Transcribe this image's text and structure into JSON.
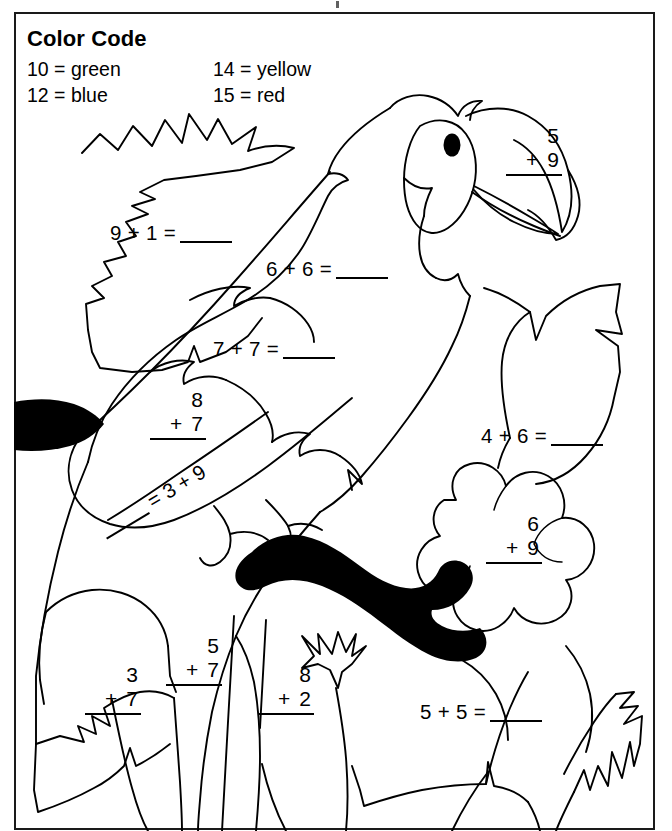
{
  "worksheet": {
    "legend_title": "Color Code",
    "legend": [
      {
        "code": "10 = green",
        "code2": "14 = yellow"
      },
      {
        "code": "12 = blue",
        "code2": "15 = red"
      }
    ],
    "legend_rows": [
      {
        "left": "10 = green",
        "right": "14 = yellow"
      },
      {
        "left": "12 = blue",
        "right": "15 = red"
      }
    ],
    "colors": {
      "green": "#2e8b2e",
      "blue": "#2b57c4",
      "yellow": "#e8d33a",
      "red": "#cf2222",
      "ink": "#000000",
      "paper": "#ffffff"
    },
    "problems": [
      {
        "id": "p1",
        "format": "horizontal",
        "text": "9 + 1 =",
        "a": "9",
        "b": "1",
        "answer": ""
      },
      {
        "id": "p2",
        "format": "horizontal",
        "text": "6 + 6 =",
        "a": "6",
        "b": "6",
        "answer": ""
      },
      {
        "id": "p3",
        "format": "horizontal",
        "text": "7 + 7 =",
        "a": "7",
        "b": "7",
        "answer": ""
      },
      {
        "id": "p4",
        "format": "vertical",
        "top": "5",
        "op": "+",
        "bottom": "9",
        "answer": ""
      },
      {
        "id": "p5",
        "format": "vertical",
        "top": "8",
        "op": "+",
        "bottom": "7",
        "answer": ""
      },
      {
        "id": "p6",
        "format": "reversed",
        "text": "= 3 + 9",
        "a": "3",
        "b": "9",
        "answer": ""
      },
      {
        "id": "p7",
        "format": "horizontal",
        "text": "4 + 6 =",
        "a": "4",
        "b": "6",
        "answer": ""
      },
      {
        "id": "p8",
        "format": "vertical",
        "top": "6",
        "op": "+",
        "bottom": "9",
        "answer": ""
      },
      {
        "id": "p9",
        "format": "vertical",
        "top": "3",
        "op": "+",
        "bottom": "7",
        "answer": ""
      },
      {
        "id": "p10",
        "format": "vertical",
        "top": "5",
        "op": "+",
        "bottom": "7",
        "answer": ""
      },
      {
        "id": "p11",
        "format": "vertical",
        "top": "8",
        "op": "+",
        "bottom": "2",
        "answer": ""
      },
      {
        "id": "p12",
        "format": "horizontal",
        "text": "5 + 5 =",
        "a": "5",
        "b": "5",
        "answer": ""
      }
    ],
    "p1": {
      "expr": "9 + 1 ="
    },
    "p2": {
      "expr": "6 + 6 ="
    },
    "p3": {
      "expr": "7 + 7 ="
    },
    "p4": {
      "top": "5",
      "bottom": "9",
      "op": "+"
    },
    "p5": {
      "top": "8",
      "bottom": "7",
      "op": "+"
    },
    "p6": {
      "expr": "= 3 + 9"
    },
    "p7": {
      "expr": "4 + 6 ="
    },
    "p8": {
      "top": "6",
      "bottom": "9",
      "op": "+"
    },
    "p9": {
      "top": "3",
      "bottom": "7",
      "op": "+"
    },
    "p10": {
      "top": "5",
      "bottom": "7",
      "op": "+"
    },
    "p11": {
      "top": "8",
      "bottom": "2",
      "op": "+"
    },
    "p12": {
      "expr": "5 + 5 ="
    }
  }
}
